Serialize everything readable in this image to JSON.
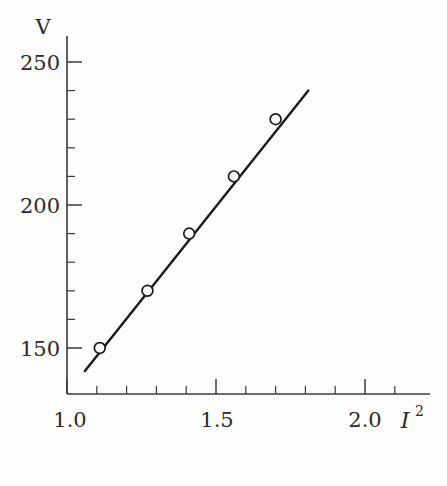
{
  "chart_data": {
    "type": "line",
    "title": "",
    "subtitle": "",
    "xlabel": "I",
    "xlabel_sup": "2",
    "ylabel": "V",
    "x": [
      1.11,
      1.27,
      1.41,
      1.56,
      1.7
    ],
    "values": [
      150,
      170,
      190,
      210,
      230
    ],
    "series": [
      {
        "name": "V vs I^2",
        "x": [
          1.11,
          1.27,
          1.41,
          1.56,
          1.7
        ],
        "values": [
          150,
          170,
          190,
          210,
          230
        ]
      }
    ],
    "fit_line": {
      "x_start": 1.06,
      "x_end": 1.81,
      "y_start": 142,
      "y_end": 240
    },
    "xlim": [
      1.0,
      2.1
    ],
    "ylim": [
      140,
      255
    ],
    "x_major_ticks": [
      1.0,
      1.5,
      2.0
    ],
    "x_major_tick_labels": [
      "1.0",
      "1.5",
      "2.0"
    ],
    "x_minor_step": 0.1,
    "y_major_ticks": [
      150,
      200,
      250
    ],
    "y_major_tick_labels": [
      "150",
      "200",
      "250"
    ],
    "y_minor_step": 10,
    "grid": false,
    "legend": "none",
    "marker_style": "open-circle",
    "line_color": "#1a1a1a",
    "marker_fill": "#fdfdfc",
    "axis_color": "#3a3a3a",
    "background_color": "#fdfdfc"
  },
  "axes": {
    "y_title": "V",
    "x_title_base": "I",
    "x_title_exponent": "2"
  },
  "y_ticks": [
    {
      "label": "250",
      "value": 250
    },
    {
      "label": "200",
      "value": 200
    },
    {
      "label": "150",
      "value": 150
    }
  ],
  "x_ticks": [
    {
      "label": "1.0",
      "value": 1.0
    },
    {
      "label": "1.5",
      "value": 1.5
    },
    {
      "label": "2.0",
      "value": 2.0
    }
  ]
}
